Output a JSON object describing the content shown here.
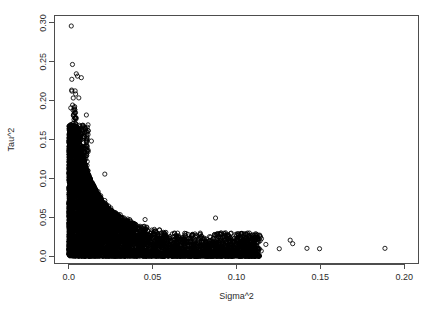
{
  "chart_data": {
    "type": "scatter",
    "title": "",
    "xlabel": "Sigma^2",
    "ylabel": "Tau^2",
    "xlim": [
      -0.0085,
      0.2085
    ],
    "ylim": [
      -0.0095,
      0.3095
    ],
    "xticks": [
      0.0,
      0.05,
      0.1,
      0.15,
      0.2
    ],
    "xticklabels": [
      "0.0",
      "0.05",
      "0.10",
      "0.15",
      "0.20"
    ],
    "yticks": [
      0.0,
      0.05,
      0.1,
      0.15,
      0.2,
      0.25,
      0.3
    ],
    "yticklabels": [
      "0.0",
      "0.05",
      "0.10",
      "0.15",
      "0.20",
      "0.25",
      "0.30"
    ],
    "grid": false,
    "legend": null,
    "marker": "open-circle",
    "marker_color": "#000000",
    "marker_size": 2.1,
    "point_count_approx": 5000,
    "notable_points": [
      {
        "x": 0.0015,
        "y": 0.296
      },
      {
        "x": 0.0022,
        "y": 0.2465
      },
      {
        "x": 0.0045,
        "y": 0.2345
      },
      {
        "x": 0.0052,
        "y": 0.2315
      },
      {
        "x": 0.0075,
        "y": 0.2295
      },
      {
        "x": 0.0038,
        "y": 0.2125
      },
      {
        "x": 0.0041,
        "y": 0.2085
      },
      {
        "x": 0.006,
        "y": 0.2035
      },
      {
        "x": 0.0105,
        "y": 0.1815
      },
      {
        "x": 0.0135,
        "y": 0.148
      },
      {
        "x": 0.0215,
        "y": 0.1055
      },
      {
        "x": 0.0175,
        "y": 0.083
      },
      {
        "x": 0.0215,
        "y": 0.0715
      },
      {
        "x": 0.0245,
        "y": 0.056
      },
      {
        "x": 0.0285,
        "y": 0.0505
      },
      {
        "x": 0.033,
        "y": 0.0425
      },
      {
        "x": 0.0455,
        "y": 0.047
      },
      {
        "x": 0.0875,
        "y": 0.049
      },
      {
        "x": 0.1095,
        "y": 0.019
      },
      {
        "x": 0.1175,
        "y": 0.015
      },
      {
        "x": 0.1255,
        "y": 0.0095
      },
      {
        "x": 0.132,
        "y": 0.0205
      },
      {
        "x": 0.1335,
        "y": 0.016
      },
      {
        "x": 0.142,
        "y": 0.01
      },
      {
        "x": 0.1495,
        "y": 0.0095
      },
      {
        "x": 0.1885,
        "y": 0.01
      }
    ]
  },
  "axes": {
    "x_axis_name": "sigma-squared-axis",
    "y_axis_name": "tau-squared-axis"
  }
}
